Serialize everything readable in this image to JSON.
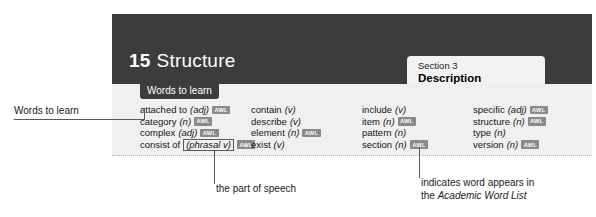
{
  "page": {
    "unit_number": "15",
    "unit_name": "Structure",
    "section_label": "Section 3",
    "section_name": "Description",
    "words_tab_label": "Words to learn"
  },
  "word_columns": [
    {
      "entries": [
        {
          "term": "attached to",
          "pos": "(adj)",
          "pos_boxed": false,
          "awl": true,
          "awl_label": "AWL"
        },
        {
          "term": "category",
          "pos": "(n)",
          "pos_boxed": false,
          "awl": true,
          "awl_label": "AWL"
        },
        {
          "term": "complex",
          "pos": "(adj)",
          "pos_boxed": false,
          "awl": true,
          "awl_label": "AWL"
        },
        {
          "term": "consist of",
          "pos": "(phrasal v)",
          "pos_boxed": true,
          "awl": true,
          "awl_label": "AWL"
        }
      ]
    },
    {
      "entries": [
        {
          "term": "contain",
          "pos": "(v)",
          "pos_boxed": false,
          "awl": false,
          "awl_label": "AWL"
        },
        {
          "term": "describe",
          "pos": "(v)",
          "pos_boxed": false,
          "awl": false,
          "awl_label": "AWL"
        },
        {
          "term": "element",
          "pos": "(n)",
          "pos_boxed": false,
          "awl": true,
          "awl_label": "AWL"
        },
        {
          "term": "exist",
          "pos": "(v)",
          "pos_boxed": false,
          "awl": false,
          "awl_label": "AWL"
        }
      ]
    },
    {
      "entries": [
        {
          "term": "include",
          "pos": "(v)",
          "pos_boxed": false,
          "awl": false,
          "awl_label": "AWL"
        },
        {
          "term": "item",
          "pos": "(n)",
          "pos_boxed": false,
          "awl": true,
          "awl_label": "AWL"
        },
        {
          "term": "pattern",
          "pos": "(n)",
          "pos_boxed": false,
          "awl": false,
          "awl_label": "AWL"
        },
        {
          "term": "section",
          "pos": "(n)",
          "pos_boxed": false,
          "awl": true,
          "awl_label": "AWL"
        }
      ]
    },
    {
      "entries": [
        {
          "term": "specific",
          "pos": "(adj)",
          "pos_boxed": false,
          "awl": true,
          "awl_label": "AWL"
        },
        {
          "term": "structure",
          "pos": "(n)",
          "pos_boxed": false,
          "awl": true,
          "awl_label": "AWL"
        },
        {
          "term": "type",
          "pos": "(n)",
          "pos_boxed": false,
          "awl": false,
          "awl_label": "AWL"
        },
        {
          "term": "version",
          "pos": "(n)",
          "pos_boxed": false,
          "awl": true,
          "awl_label": "AWL"
        }
      ]
    }
  ],
  "annotations": {
    "words_to_learn": "Words to learn",
    "part_of_speech": "the part of speech",
    "awl_line1": "indicates word appears in",
    "awl_line2_prefix": "the ",
    "awl_line2_italic": "Academic Word List"
  },
  "colors": {
    "header_band": "#3c3c3c",
    "words_panel": "#f0f0f0",
    "section_tab": "#f2f2f2",
    "awl_badge": "#8a8a8a",
    "leader_line": "#585858"
  }
}
